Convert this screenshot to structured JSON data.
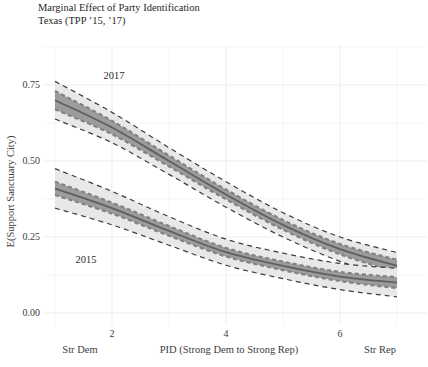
{
  "title": "Marginal Effect of Party Identification",
  "subtitle": "Texas (TPP ’15, ’17)",
  "colors": {
    "background": "#ffffff",
    "grid_major": "#efecec",
    "grid_minor": "#f7f4f4",
    "outer_band": "#e8e8e8",
    "inner_band": "#9c9c9c",
    "mean_line": "#5f5f5f",
    "outer_dash": "#3c3c3c",
    "inner_dash": "#828282",
    "text": "#3d3d3d"
  },
  "chart_data": {
    "type": "line",
    "title": "Marginal Effect of Party Identification",
    "subtitle": "Texas (TPP ’15, ’17)",
    "xlabel": "PID (Strong Dem to Strong Rep)",
    "ylabel": "E(Support Sanctuary City)",
    "x_end_labels": {
      "left": "Str Dem",
      "right": "Str Rep"
    },
    "grid": true,
    "legend": "direct curve labels",
    "xlim": [
      1,
      7
    ],
    "ylim": [
      0,
      0.88
    ],
    "x": [
      1,
      2,
      3,
      4,
      5,
      6,
      7
    ],
    "x_tick_values": [
      2,
      4,
      6
    ],
    "x_tick_labels": [
      "2",
      "4",
      "6"
    ],
    "x_minor": [
      1,
      3,
      5,
      7
    ],
    "y_tick_values": [
      0.75,
      0.5,
      0.25,
      0.0
    ],
    "y_ticks": [
      "0.75",
      "0.50",
      "0.25",
      "0.00"
    ],
    "y_minor": [
      0.875,
      0.625,
      0.375,
      0.125
    ],
    "series": [
      {
        "name": "2017",
        "mean": [
          0.7,
          0.61,
          0.5,
          0.39,
          0.29,
          0.21,
          0.155
        ],
        "inner_lo": [
          0.67,
          0.588,
          0.482,
          0.374,
          0.274,
          0.193,
          0.135
        ],
        "inner_hi": [
          0.73,
          0.632,
          0.518,
          0.406,
          0.306,
          0.227,
          0.175
        ],
        "outer_lo": [
          0.638,
          0.56,
          0.456,
          0.348,
          0.25,
          0.17,
          0.111
        ],
        "outer_hi": [
          0.762,
          0.66,
          0.544,
          0.432,
          0.33,
          0.25,
          0.199
        ]
      },
      {
        "name": "2015",
        "mean": [
          0.41,
          0.345,
          0.27,
          0.2,
          0.155,
          0.12,
          0.1
        ],
        "inner_lo": [
          0.388,
          0.327,
          0.254,
          0.186,
          0.141,
          0.105,
          0.082
        ],
        "inner_hi": [
          0.432,
          0.363,
          0.286,
          0.214,
          0.169,
          0.135,
          0.118
        ],
        "outer_lo": [
          0.345,
          0.29,
          0.223,
          0.157,
          0.113,
          0.077,
          0.053
        ],
        "outer_hi": [
          0.475,
          0.4,
          0.317,
          0.243,
          0.197,
          0.163,
          0.147
        ]
      }
    ]
  }
}
